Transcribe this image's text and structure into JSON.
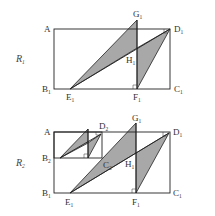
{
  "figures": [
    {
      "name": "R1",
      "label": {
        "main": "R",
        "sub": "1"
      },
      "points": [
        {
          "id": "A",
          "main": "A",
          "sub": ""
        },
        {
          "id": "B1",
          "main": "B",
          "sub": "1"
        },
        {
          "id": "C1",
          "main": "C",
          "sub": "1"
        },
        {
          "id": "D1",
          "main": "D",
          "sub": "1"
        },
        {
          "id": "E1",
          "main": "E",
          "sub": "1"
        },
        {
          "id": "F1",
          "main": "F",
          "sub": "1"
        },
        {
          "id": "G1",
          "main": "G",
          "sub": "1"
        },
        {
          "id": "H1",
          "main": "H",
          "sub": "1"
        }
      ]
    },
    {
      "name": "R2",
      "label": {
        "main": "R",
        "sub": "2"
      },
      "points": [
        {
          "id": "A",
          "main": "A",
          "sub": ""
        },
        {
          "id": "B2",
          "main": "B",
          "sub": "2"
        },
        {
          "id": "C2",
          "main": "C",
          "sub": "2"
        },
        {
          "id": "D2",
          "main": "D",
          "sub": "2"
        },
        {
          "id": "G1",
          "main": "G",
          "sub": "1"
        },
        {
          "id": "D1",
          "main": "D",
          "sub": "1"
        },
        {
          "id": "H1",
          "main": "H",
          "sub": "1"
        },
        {
          "id": "B1",
          "main": "B",
          "sub": "1"
        },
        {
          "id": "E1",
          "main": "E",
          "sub": "1"
        },
        {
          "id": "F1",
          "main": "F",
          "sub": "1"
        },
        {
          "id": "C1",
          "main": "C",
          "sub": "1"
        }
      ]
    }
  ],
  "colors": {
    "shade": "#a8a8a8",
    "line": "#222222"
  }
}
